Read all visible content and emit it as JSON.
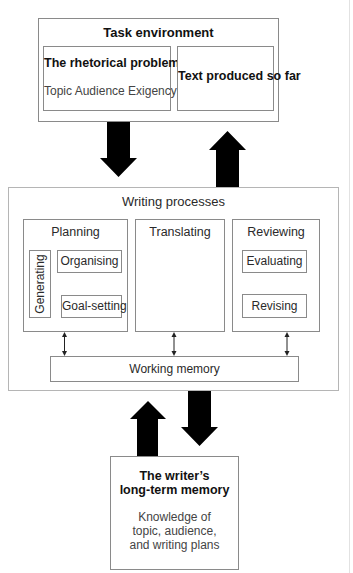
{
  "task_environment": {
    "title": "Task environment",
    "rhetorical_problem": {
      "title": "The rhetorical problem",
      "subtitle": "Topic Audience Exigency"
    },
    "text_produced": {
      "title": "Text produced so far"
    }
  },
  "writing_processes": {
    "title": "Writing processes",
    "planning": {
      "title": "Planning",
      "generating": "Generating",
      "organising": "Organising",
      "goal_setting": "Goal-setting"
    },
    "translating": {
      "title": "Translating"
    },
    "reviewing": {
      "title": "Reviewing",
      "evaluating": "Evaluating",
      "revising": "Revising"
    },
    "working_memory": "Working memory"
  },
  "long_term_memory": {
    "title_line1": "The writer’s",
    "title_line2": "long-term memory",
    "body_line1": "Knowledge of",
    "body_line2": "topic, audience,",
    "body_line3": "and writing plans"
  },
  "colors": {
    "arrow": "#000000",
    "border": "#8a8a8a",
    "text": "#2a2a2a"
  }
}
